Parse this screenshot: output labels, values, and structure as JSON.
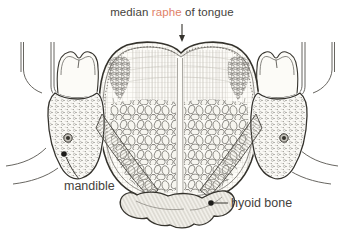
{
  "figure": {
    "caption": {
      "pre": "median ",
      "highlight": "raphe",
      "post": " of tongue"
    },
    "labels": {
      "mandible": "mandible",
      "hyoid": "hyoid bone"
    },
    "icons": {
      "arrow": "down-arrow-pointer",
      "leader_dots": "label-leader-dot"
    }
  },
  "colors": {
    "ink": "#35332d",
    "label_text": "#45423c",
    "highlight": "#df8168",
    "paper": "#ffffff"
  }
}
